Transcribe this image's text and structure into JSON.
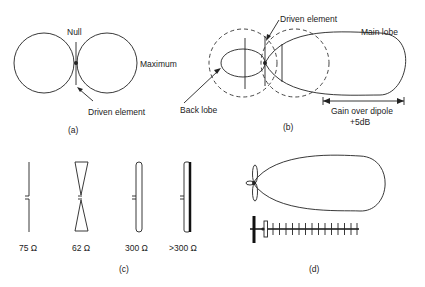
{
  "panels": {
    "a": {
      "caption": "(a)",
      "labels": {
        "null": "Null",
        "maximum": "Maximum",
        "driven": "Driven element"
      }
    },
    "b": {
      "caption": "(b)",
      "labels": {
        "driven": "Driven element",
        "main_lobe": "Main lobe",
        "back_lobe": "Back lobe",
        "gain_line1": "Gain over dipole",
        "gain_line2": "+5dB"
      }
    },
    "c": {
      "caption": "(c)",
      "elements": [
        {
          "type": "thin-dipole",
          "impedance": "75 Ω"
        },
        {
          "type": "bow-tie",
          "impedance": "62 Ω"
        },
        {
          "type": "folded-dipole",
          "impedance": "300 Ω"
        },
        {
          "type": "folded-dipole-unequal",
          "impedance": ">300 Ω"
        }
      ]
    },
    "d": {
      "caption": "(d)",
      "directors_count": 14
    }
  },
  "colors": {
    "line": "#222222",
    "background": "#ffffff"
  }
}
